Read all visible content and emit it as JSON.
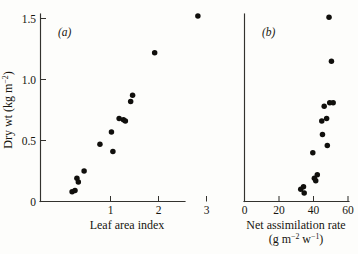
{
  "figure": {
    "background_color": "#fdfdfb",
    "ink_color": "#17150f",
    "point_color": "#100f0c"
  },
  "panel_a": {
    "label": "(a)",
    "x_title": "Leaf area index",
    "x_ticks": [
      "1",
      "2",
      "3"
    ],
    "x_tick_values": [
      1,
      2,
      3
    ]
  },
  "panel_b": {
    "label": "(b)",
    "x_title_line1": "Net assimilation rate",
    "x_title_line2_prefix": "(g m",
    "x_title_line2_sup1": "−2",
    "x_title_line2_mid": " w",
    "x_title_line2_sup2": "−1",
    "x_title_line2_suffix": ")",
    "x_ticks": [
      "0",
      "20",
      "40",
      "60"
    ],
    "x_tick_values": [
      0,
      20,
      40,
      60
    ]
  },
  "y_axis": {
    "title_prefix": "Dry wt (kg m",
    "title_sup": "−2",
    "title_suffix": ")",
    "ticks": [
      "0",
      "0.5",
      "1.0",
      "1.5"
    ],
    "tick_values": [
      0,
      0.5,
      1.0,
      1.5
    ]
  },
  "chart_data": [
    {
      "type": "scatter",
      "panel": "a",
      "title": "(a)",
      "xlabel": "Leaf area index",
      "ylabel": "Dry wt (kg m−2)",
      "xlim": [
        0,
        3.1
      ],
      "ylim": [
        0,
        1.62
      ],
      "grid": false,
      "legend": "none",
      "x": [
        0.2,
        0.26,
        0.3,
        0.33,
        0.45,
        0.78,
        1.02,
        1.05,
        1.18,
        1.27,
        1.31,
        1.42,
        1.46,
        1.92,
        2.82
      ],
      "y": [
        0.08,
        0.09,
        0.19,
        0.16,
        0.25,
        0.47,
        0.57,
        0.41,
        0.68,
        0.67,
        0.66,
        0.82,
        0.87,
        1.22,
        1.52
      ]
    },
    {
      "type": "scatter",
      "panel": "b",
      "title": "(b)",
      "xlabel": "Net assimilation rate (g m−2 w−1)",
      "ylabel": "Dry wt (kg m−2)",
      "xlim": [
        0,
        62
      ],
      "ylim": [
        0,
        1.62
      ],
      "grid": false,
      "legend": "none",
      "x": [
        32.6,
        34.2,
        34.6,
        40.5,
        41.3,
        42.2,
        39.6,
        44.8,
        45.2,
        47.6,
        48.0,
        46.2,
        49.4,
        50.4,
        49.0,
        51.4
      ],
      "y": [
        0.1,
        0.12,
        0.07,
        0.19,
        0.17,
        0.22,
        0.4,
        0.66,
        0.55,
        0.68,
        0.46,
        0.78,
        0.81,
        1.15,
        1.51,
        0.81
      ]
    }
  ]
}
